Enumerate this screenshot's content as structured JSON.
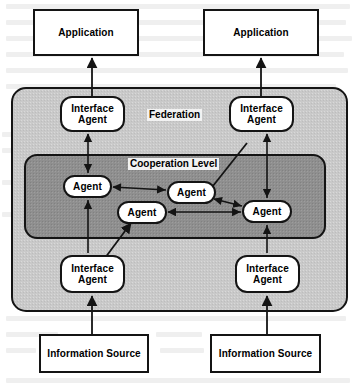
{
  "diagram": {
    "colors": {
      "page_bg": "#ffffff",
      "federation_fill": "#c9c9c9",
      "cooperation_fill": "#8f8f8f",
      "stroke": "#1a1a1a",
      "node_fill": "#ffffff",
      "label_bg": "#f2f2f2"
    },
    "regions": [
      {
        "id": "federation",
        "label": "Federation",
        "x": 12,
        "y": 88,
        "w": 335,
        "h": 223,
        "fill": "#c9c9c9",
        "radius": 14
      },
      {
        "id": "cooperation",
        "label": "Cooperation Level",
        "x": 25,
        "y": 155,
        "w": 300,
        "h": 83,
        "fill": "#8f8f8f",
        "radius": 12
      }
    ],
    "region_labels": [
      {
        "id": "federation-label",
        "text": "Federation",
        "x": 147,
        "y": 109
      },
      {
        "id": "cooperation-label",
        "text": "Cooperation Level",
        "x": 128,
        "y": 158
      }
    ],
    "boxes": [
      {
        "id": "application-left",
        "text": "Application",
        "x": 34,
        "y": 10,
        "w": 104,
        "h": 45
      },
      {
        "id": "application-right",
        "text": "Application",
        "x": 204,
        "y": 10,
        "w": 114,
        "h": 45
      },
      {
        "id": "info-source-left",
        "text": "Information Source",
        "x": 40,
        "y": 335,
        "w": 108,
        "h": 37
      },
      {
        "id": "info-source-right",
        "text": "Information Source",
        "x": 211,
        "y": 335,
        "w": 109,
        "h": 37
      }
    ],
    "nodes": [
      {
        "id": "interface-agent-top-left",
        "text": "Interface Agent",
        "line1": "Interface",
        "line2": "Agent",
        "x": 61,
        "y": 97,
        "w": 63,
        "h": 34
      },
      {
        "id": "interface-agent-top-right",
        "text": "Interface Agent",
        "line1": "Interface",
        "line2": "Agent",
        "x": 230,
        "y": 97,
        "w": 63,
        "h": 34
      },
      {
        "id": "interface-agent-bottom-left",
        "text": "Interface Agent",
        "line1": "Interface",
        "line2": "Agent",
        "x": 61,
        "y": 256,
        "w": 63,
        "h": 36
      },
      {
        "id": "interface-agent-bottom-right",
        "text": "Interface Agent",
        "line1": "Interface",
        "line2": "Agent",
        "x": 236,
        "y": 256,
        "w": 63,
        "h": 36
      },
      {
        "id": "agent-1",
        "text": "Agent",
        "x": 64,
        "y": 176,
        "w": 47,
        "h": 21
      },
      {
        "id": "agent-2",
        "text": "Agent",
        "x": 168,
        "y": 182,
        "w": 47,
        "h": 21
      },
      {
        "id": "agent-3",
        "text": "Agent",
        "x": 118,
        "y": 202,
        "w": 48,
        "h": 21
      },
      {
        "id": "agent-4",
        "text": "Agent",
        "x": 243,
        "y": 201,
        "w": 48,
        "h": 21
      }
    ],
    "edges": [
      {
        "id": "edge-info-left-to-iface-bottom-left",
        "from": "info-source-left",
        "to": "interface-agent-bottom-left",
        "heads": "end"
      },
      {
        "id": "edge-info-right-to-iface-bottom-right",
        "from": "info-source-right",
        "to": "interface-agent-bottom-right",
        "heads": "end"
      },
      {
        "id": "edge-iface-top-left-to-app-left",
        "from": "interface-agent-top-left",
        "to": "application-left",
        "heads": "end"
      },
      {
        "id": "edge-iface-top-right-to-app-right",
        "from": "interface-agent-top-right",
        "to": "application-right",
        "heads": "end"
      },
      {
        "id": "edge-iface-top-left-agent-1",
        "from": "interface-agent-top-left",
        "to": "agent-1",
        "heads": "both"
      },
      {
        "id": "edge-iface-bottom-left-to-agent-3",
        "from": "interface-agent-bottom-left",
        "to": "agent-3",
        "heads": "end"
      },
      {
        "id": "edge-iface-top-right-agent-4",
        "from": "interface-agent-top-right",
        "to": "agent-4",
        "heads": "both"
      },
      {
        "id": "edge-iface-bottom-right-to-agent-4",
        "from": "interface-agent-bottom-right",
        "to": "agent-4",
        "heads": "end"
      },
      {
        "id": "edge-iface-bottom-right-to-agent-2",
        "from": "interface-agent-bottom-right",
        "to": "agent-2",
        "heads": "end"
      },
      {
        "id": "edge-agent-1-agent-2",
        "from": "agent-1",
        "to": "agent-2",
        "heads": "both"
      },
      {
        "id": "edge-agent-2-agent-4",
        "from": "agent-2",
        "to": "agent-4",
        "heads": "both"
      },
      {
        "id": "edge-agent-3-agent-4",
        "from": "agent-3",
        "to": "agent-4",
        "heads": "both"
      }
    ]
  }
}
